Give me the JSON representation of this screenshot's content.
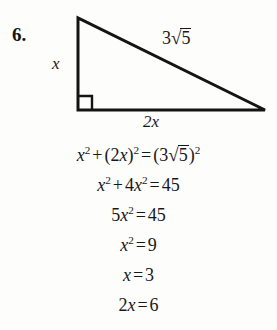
{
  "problem": {
    "number": "6."
  },
  "figure": {
    "name": "right-triangle",
    "shape": "right triangle",
    "right_angle_marker": true,
    "labels": {
      "vertical_leg": "x",
      "horizontal_leg": "2x",
      "hypotenuse_coefficient": "3",
      "hypotenuse_radicand": "5",
      "hypotenuse_full": "3√5"
    },
    "geometry": {
      "apex": [
        78,
        18
      ],
      "right_angle_vertex": [
        78,
        110
      ],
      "far_vertex": [
        265,
        110
      ],
      "stroke_color": "#141412",
      "stroke_width": 3
    }
  },
  "solution": {
    "lines": [
      {
        "id": "line-1",
        "plain": "x^2 + (2x)^2 = (3√5)^2",
        "parts": [
          {
            "t": "var",
            "v": "x"
          },
          {
            "t": "sup",
            "v": "2"
          },
          {
            "t": "op",
            "v": "+"
          },
          {
            "t": "txt",
            "v": "(2"
          },
          {
            "t": "var",
            "v": "x"
          },
          {
            "t": "txt",
            "v": ")"
          },
          {
            "t": "sup",
            "v": "2"
          },
          {
            "t": "op",
            "v": "="
          },
          {
            "t": "txt",
            "v": "(3"
          },
          {
            "t": "rad",
            "v": "5"
          },
          {
            "t": "txt",
            "v": ")"
          },
          {
            "t": "sup",
            "v": "2"
          }
        ]
      },
      {
        "id": "line-2",
        "plain": "x^2 + 4x^2 = 45",
        "parts": [
          {
            "t": "var",
            "v": "x"
          },
          {
            "t": "sup",
            "v": "2"
          },
          {
            "t": "op",
            "v": "+"
          },
          {
            "t": "txt",
            "v": "4"
          },
          {
            "t": "var",
            "v": "x"
          },
          {
            "t": "sup",
            "v": "2"
          },
          {
            "t": "op",
            "v": "="
          },
          {
            "t": "txt",
            "v": "45"
          }
        ]
      },
      {
        "id": "line-3",
        "plain": "5x^2 = 45",
        "parts": [
          {
            "t": "txt",
            "v": "5"
          },
          {
            "t": "var",
            "v": "x"
          },
          {
            "t": "sup",
            "v": "2"
          },
          {
            "t": "op",
            "v": "="
          },
          {
            "t": "txt",
            "v": "45"
          }
        ]
      },
      {
        "id": "line-4",
        "plain": "x^2 = 9",
        "parts": [
          {
            "t": "var",
            "v": "x"
          },
          {
            "t": "sup",
            "v": "2"
          },
          {
            "t": "op",
            "v": "="
          },
          {
            "t": "txt",
            "v": "9"
          }
        ]
      },
      {
        "id": "line-5",
        "plain": "x = 3",
        "parts": [
          {
            "t": "var",
            "v": "x"
          },
          {
            "t": "op",
            "v": "="
          },
          {
            "t": "txt",
            "v": "3"
          }
        ]
      },
      {
        "id": "line-6",
        "plain": "2x = 6",
        "parts": [
          {
            "t": "txt",
            "v": "2"
          },
          {
            "t": "var",
            "v": "x"
          },
          {
            "t": "op",
            "v": "="
          },
          {
            "t": "txt",
            "v": "6"
          }
        ]
      }
    ]
  },
  "colors": {
    "page_background": "#fdfdfc",
    "ink": "#18181a",
    "figure_stroke": "#141412"
  }
}
